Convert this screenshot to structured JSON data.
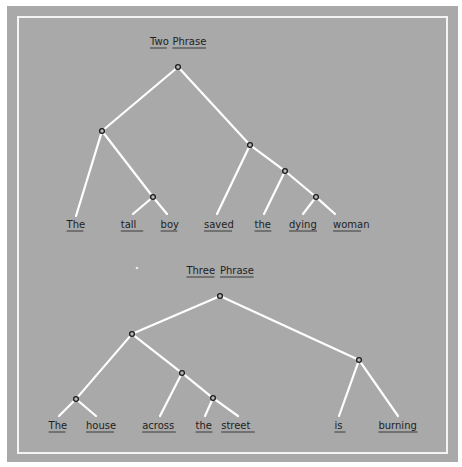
{
  "colors": {
    "page_background": "#ffffff",
    "panel_background": "#a9a9a9",
    "frame_border": "#f4f4f4",
    "edge": "#ffffff",
    "node_ring": "#1c1c1c",
    "text": "#222222"
  },
  "trees": [
    {
      "id": "two-phrase",
      "title": {
        "words": [
          "Two",
          "Phrase"
        ],
        "x": 178,
        "y": 45
      },
      "nodes": [
        {
          "id": "root",
          "x": 178,
          "y": 67
        },
        {
          "id": "np",
          "x": 102,
          "y": 131
        },
        {
          "id": "adjn",
          "x": 153,
          "y": 197
        },
        {
          "id": "vp",
          "x": 250,
          "y": 145
        },
        {
          "id": "np2",
          "x": 285,
          "y": 171
        },
        {
          "id": "adjn2",
          "x": 316,
          "y": 197
        }
      ],
      "leaves": [
        {
          "id": "w1",
          "text": "The",
          "x": 75,
          "y": 228,
          "line_end": [
            76,
            216
          ]
        },
        {
          "id": "w2",
          "text": "tall",
          "x": 132,
          "y": 228,
          "line_end": [
            133,
            214
          ]
        },
        {
          "id": "w3",
          "text": "boy",
          "x": 169,
          "y": 228,
          "line_end": [
            167,
            214
          ]
        },
        {
          "id": "w4",
          "text": "saved",
          "x": 218,
          "y": 228,
          "line_end": [
            217,
            214
          ]
        },
        {
          "id": "w5",
          "text": "the",
          "x": 263,
          "y": 228,
          "line_end": [
            264,
            214
          ]
        },
        {
          "id": "w6",
          "text": "dying",
          "x": 303,
          "y": 228,
          "line_end": [
            303,
            214
          ]
        },
        {
          "id": "w7",
          "text": "woman",
          "x": 347,
          "y": 228,
          "line_end": [
            335,
            214
          ]
        }
      ],
      "edges": [
        [
          "root",
          "np"
        ],
        [
          "root",
          "vp"
        ],
        [
          "np",
          "w1"
        ],
        [
          "np",
          "adjn"
        ],
        [
          "adjn",
          "w2"
        ],
        [
          "adjn",
          "w3"
        ],
        [
          "vp",
          "w4"
        ],
        [
          "vp",
          "np2"
        ],
        [
          "np2",
          "w5"
        ],
        [
          "np2",
          "adjn2"
        ],
        [
          "adjn2",
          "w6"
        ],
        [
          "adjn2",
          "w7"
        ]
      ]
    },
    {
      "id": "three-phrase",
      "title": {
        "words": [
          "Three",
          "Phrase"
        ],
        "x": 220,
        "y": 274
      },
      "nodes": [
        {
          "id": "root",
          "x": 220,
          "y": 296
        },
        {
          "id": "np",
          "x": 132,
          "y": 334
        },
        {
          "id": "detn",
          "x": 76,
          "y": 399
        },
        {
          "id": "pp",
          "x": 182,
          "y": 373
        },
        {
          "id": "detn2",
          "x": 213,
          "y": 398
        },
        {
          "id": "vp",
          "x": 359,
          "y": 360
        }
      ],
      "leaves": [
        {
          "id": "w1",
          "text": "The",
          "x": 57,
          "y": 429,
          "line_end": [
            59,
            416
          ]
        },
        {
          "id": "w2",
          "text": "house",
          "x": 100,
          "y": 429,
          "line_end": [
            96,
            416
          ]
        },
        {
          "id": "w3",
          "text": "across",
          "x": 159,
          "y": 429,
          "line_end": [
            160,
            416
          ]
        },
        {
          "id": "w4",
          "text": "the",
          "x": 204,
          "y": 429,
          "line_end": [
            205,
            416
          ]
        },
        {
          "id": "w5",
          "text": "street",
          "x": 238,
          "y": 429,
          "line_end": [
            238,
            416
          ]
        },
        {
          "id": "w6",
          "text": "is",
          "x": 340,
          "y": 429,
          "line_end": [
            339,
            416
          ]
        },
        {
          "id": "w7",
          "text": "burning",
          "x": 398,
          "y": 429,
          "line_end": [
            398,
            416
          ]
        }
      ],
      "edges": [
        [
          "root",
          "np"
        ],
        [
          "root",
          "vp"
        ],
        [
          "np",
          "detn"
        ],
        [
          "np",
          "pp"
        ],
        [
          "detn",
          "w1"
        ],
        [
          "detn",
          "w2"
        ],
        [
          "pp",
          "w3"
        ],
        [
          "pp",
          "detn2"
        ],
        [
          "detn2",
          "w4"
        ],
        [
          "detn2",
          "w5"
        ],
        [
          "vp",
          "w6"
        ],
        [
          "vp",
          "w7"
        ]
      ]
    }
  ]
}
